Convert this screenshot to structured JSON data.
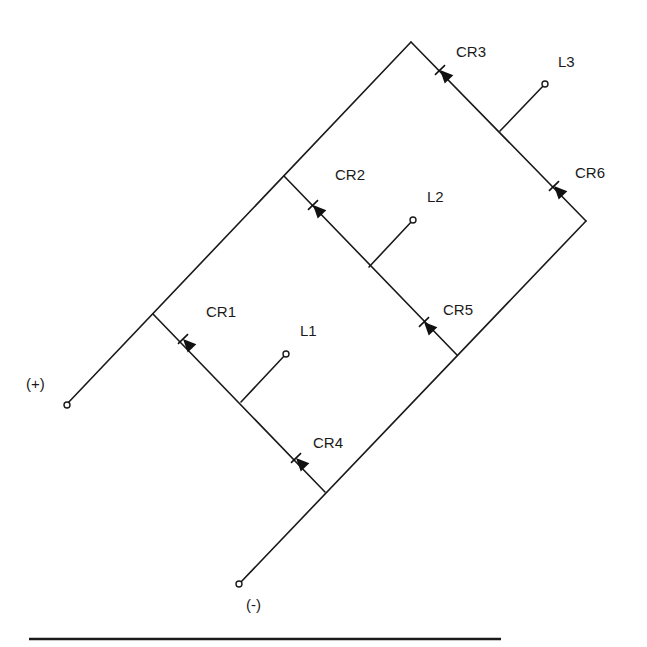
{
  "diagram": {
    "terminals": {
      "positive": "(+)",
      "negative": "(-)"
    },
    "diodes": [
      {
        "id": "cr1",
        "label": "CR1"
      },
      {
        "id": "cr2",
        "label": "CR2"
      },
      {
        "id": "cr3",
        "label": "CR3"
      },
      {
        "id": "cr4",
        "label": "CR4"
      },
      {
        "id": "cr5",
        "label": "CR5"
      },
      {
        "id": "cr6",
        "label": "CR6"
      }
    ],
    "loads": [
      {
        "id": "l1",
        "label": "L1"
      },
      {
        "id": "l2",
        "label": "L2"
      },
      {
        "id": "l3",
        "label": "L3"
      }
    ]
  }
}
